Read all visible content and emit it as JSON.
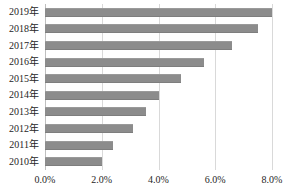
{
  "chart_data": {
    "type": "bar",
    "orientation": "horizontal",
    "title": "",
    "xlabel": "",
    "ylabel": "",
    "categories": [
      "2019年",
      "2018年",
      "2017年",
      "2016年",
      "2015年",
      "2014年",
      "2013年",
      "2012年",
      "2011年",
      "2010年"
    ],
    "values": [
      8.0,
      7.5,
      6.6,
      5.6,
      4.8,
      4.0,
      3.55,
      3.1,
      2.4,
      2.0
    ],
    "value_suffix": "%",
    "xlim": [
      0.0,
      8.0
    ],
    "xticks": [
      0.0,
      2.0,
      4.0,
      6.0,
      8.0
    ],
    "xticklabels": [
      "0.0%",
      "2.0%",
      "4.0%",
      "6.0%",
      "8.0%"
    ],
    "grid": true,
    "grid_axis": "x",
    "legend": false,
    "legend_position": "none",
    "series": [
      {
        "name": "",
        "color": "#8c8c8c",
        "values": [
          8.0,
          7.5,
          6.6,
          5.6,
          4.8,
          4.0,
          3.55,
          3.1,
          2.4,
          2.0
        ]
      }
    ]
  },
  "style": {
    "bar_color": "#8c8c8c",
    "grid_color": "#d9d9d9",
    "axis_color": "#bfbfbf",
    "text_color": "#262626",
    "background": "#ffffff"
  }
}
